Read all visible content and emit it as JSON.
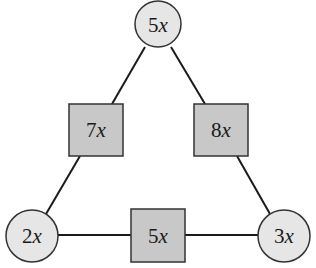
{
  "diagram": {
    "type": "triangle-network",
    "colors": {
      "circle_fill": "#e6e6e6",
      "square_fill": "#c8c8c8",
      "stroke": "#1a1a1a"
    },
    "circles": [
      {
        "id": "top",
        "coef": "5",
        "var": "x",
        "cx": 158,
        "cy": 24,
        "r": 23
      },
      {
        "id": "bottom-left",
        "coef": "2",
        "var": "x",
        "cx": 32,
        "cy": 236,
        "r": 26
      },
      {
        "id": "bottom-right",
        "coef": "3",
        "var": "x",
        "cx": 284,
        "cy": 236,
        "r": 26
      }
    ],
    "squares": [
      {
        "id": "left",
        "coef": "7",
        "var": "x",
        "x": 69,
        "y": 104,
        "w": 54,
        "h": 52
      },
      {
        "id": "right",
        "coef": "8",
        "var": "x",
        "x": 194,
        "y": 104,
        "w": 54,
        "h": 52
      },
      {
        "id": "bottom",
        "coef": "5",
        "var": "x",
        "x": 131,
        "y": 209,
        "w": 54,
        "h": 53
      }
    ]
  }
}
